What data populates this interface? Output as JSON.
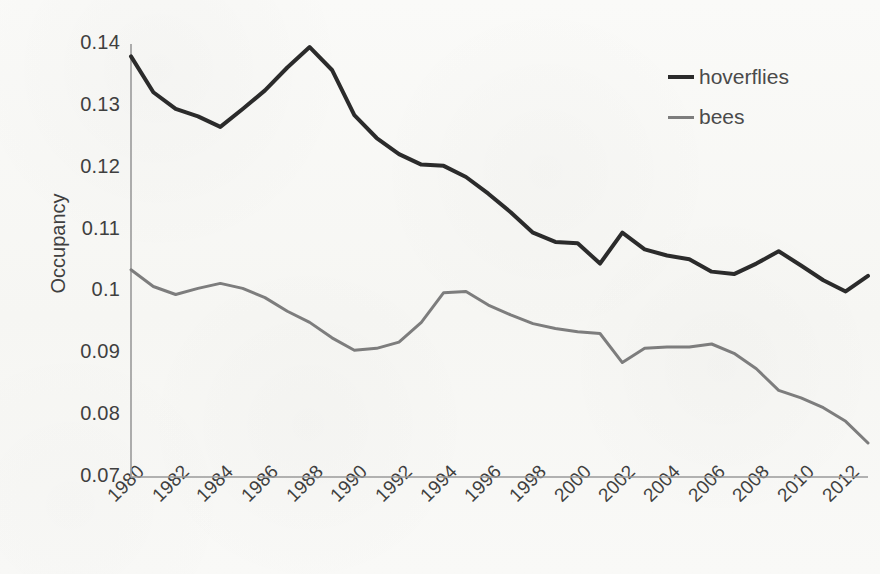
{
  "chart_data": {
    "type": "line",
    "title": "",
    "subtitle": "",
    "xlabel": "",
    "ylabel": "Occupancy",
    "xlim": [
      1980,
      2013
    ],
    "ylim": [
      0.07,
      0.14
    ],
    "grid": false,
    "legend_position": "top-right",
    "x_tick_labels": [
      "1980",
      "1982",
      "1984",
      "1986",
      "1988",
      "1990",
      "1992",
      "1994",
      "1996",
      "1998",
      "2000",
      "2002",
      "2004",
      "2006",
      "2008",
      "2010",
      "2012"
    ],
    "y_tick_labels": [
      "0.14",
      "0.13",
      "0.12",
      "0.11",
      "0.1",
      "0.09",
      "0.08",
      "0.07"
    ],
    "y_tick_values": [
      0.14,
      0.13,
      0.12,
      0.11,
      0.1,
      0.09,
      0.08,
      0.07
    ],
    "x": [
      1980,
      1981,
      1982,
      1983,
      1984,
      1985,
      1986,
      1987,
      1988,
      1989,
      1990,
      1991,
      1992,
      1993,
      1994,
      1995,
      1996,
      1997,
      1998,
      1999,
      2000,
      2001,
      2002,
      2003,
      2004,
      2005,
      2006,
      2007,
      2008,
      2009,
      2010,
      2011,
      2012,
      2013
    ],
    "series": [
      {
        "name": "hoverflies",
        "color": "#2b2b2b",
        "line_width": 4,
        "values": [
          0.138,
          0.1322,
          0.1295,
          0.1283,
          0.1266,
          0.1295,
          0.1325,
          0.1362,
          0.1395,
          0.1358,
          0.1285,
          0.1248,
          0.1222,
          0.1205,
          0.1203,
          0.1185,
          0.1158,
          0.1128,
          0.1095,
          0.108,
          0.1078,
          0.1045,
          0.1095,
          0.1068,
          0.1058,
          0.1052,
          0.1032,
          0.1028,
          0.1045,
          0.1065,
          0.1042,
          0.1018,
          0.1,
          0.1025
        ]
      },
      {
        "name": "bees",
        "color": "#7d7d7d",
        "line_width": 3,
        "values": [
          0.1035,
          0.1008,
          0.0995,
          0.1005,
          0.1013,
          0.1005,
          0.099,
          0.0968,
          0.095,
          0.0925,
          0.0905,
          0.0908,
          0.0918,
          0.095,
          0.0998,
          0.1,
          0.0978,
          0.0962,
          0.0948,
          0.094,
          0.0935,
          0.0932,
          0.0885,
          0.0908,
          0.091,
          0.091,
          0.0915,
          0.09,
          0.0875,
          0.084,
          0.0828,
          0.0812,
          0.079,
          0.0755
        ]
      }
    ]
  },
  "legend": {
    "entries": [
      {
        "label": "hoverflies"
      },
      {
        "label": "bees"
      }
    ]
  },
  "axes": {
    "y_title": "Occupancy"
  }
}
